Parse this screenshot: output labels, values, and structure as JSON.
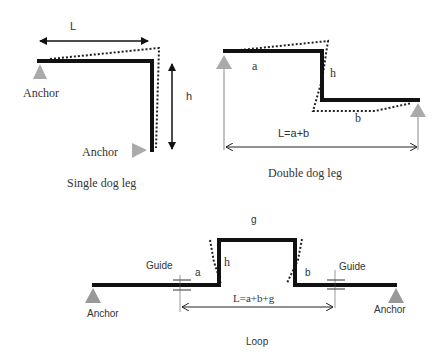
{
  "colors": {
    "pipe": "#111111",
    "deflection": "#222222",
    "anchor": "#aaaaaa",
    "dimension": "#222222",
    "text": "#333333"
  },
  "single_dog_leg": {
    "title": "Single dog leg",
    "length_label": "L",
    "height_label": "h",
    "anchor_top_label": "Anchor",
    "anchor_bottom_label": "Anchor"
  },
  "double_dog_leg": {
    "title": "Double dog leg",
    "segment_a_label": "a",
    "segment_b_label": "b",
    "height_label": "h",
    "length_label": "L=a+b"
  },
  "loop": {
    "title": "Loop",
    "top_label": "g",
    "height_label": "h",
    "segment_a_label": "a",
    "segment_b_label": "b",
    "length_label": "L=a+b+g",
    "guide_left_label": "Guide",
    "guide_right_label": "Guide",
    "anchor_left_label": "Anchor",
    "anchor_right_label": "Anchor"
  }
}
